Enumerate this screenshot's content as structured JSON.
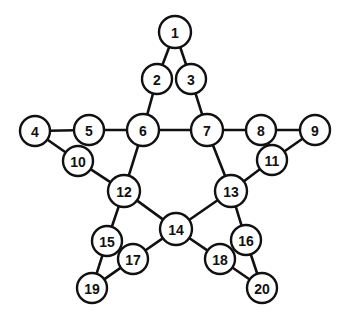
{
  "figure": {
    "type": "node-link-diagram",
    "background_color": "#ffffff",
    "edge_color": "#111111",
    "node_fill_color": "#ffffff",
    "node_stroke_color": "#111111",
    "label_color": "#111111",
    "node_radius": 15,
    "node_radius_small": 14,
    "edge_width": 2.6,
    "canvas": {
      "width": 343,
      "height": 314
    }
  },
  "nodes": [
    {
      "id": 1,
      "label": "1",
      "x": 175,
      "y": 32,
      "r": 16
    },
    {
      "id": 2,
      "label": "2",
      "x": 157,
      "y": 79,
      "r": 15
    },
    {
      "id": 3,
      "label": "3",
      "x": 191,
      "y": 79,
      "r": 15
    },
    {
      "id": 4,
      "label": "4",
      "x": 35,
      "y": 131,
      "r": 15
    },
    {
      "id": 5,
      "label": "5",
      "x": 89,
      "y": 130,
      "r": 15
    },
    {
      "id": 6,
      "label": "6",
      "x": 143,
      "y": 130,
      "r": 16
    },
    {
      "id": 7,
      "label": "7",
      "x": 207,
      "y": 130,
      "r": 16
    },
    {
      "id": 8,
      "label": "8",
      "x": 261,
      "y": 130,
      "r": 15
    },
    {
      "id": 9,
      "label": "9",
      "x": 315,
      "y": 130,
      "r": 15
    },
    {
      "id": 10,
      "label": "10",
      "x": 78,
      "y": 161,
      "r": 15
    },
    {
      "id": 11,
      "label": "11",
      "x": 272,
      "y": 160,
      "r": 15
    },
    {
      "id": 12,
      "label": "12",
      "x": 124,
      "y": 191,
      "r": 16
    },
    {
      "id": 13,
      "label": "13",
      "x": 231,
      "y": 191,
      "r": 16
    },
    {
      "id": 14,
      "label": "14",
      "x": 176,
      "y": 229,
      "r": 16
    },
    {
      "id": 15,
      "label": "15",
      "x": 107,
      "y": 241,
      "r": 15
    },
    {
      "id": 16,
      "label": "16",
      "x": 246,
      "y": 240,
      "r": 15
    },
    {
      "id": 17,
      "label": "17",
      "x": 133,
      "y": 259,
      "r": 15
    },
    {
      "id": 18,
      "label": "18",
      "x": 220,
      "y": 259,
      "r": 15
    },
    {
      "id": 19,
      "label": "19",
      "x": 92,
      "y": 288,
      "r": 15
    },
    {
      "id": 20,
      "label": "20",
      "x": 262,
      "y": 288,
      "r": 15
    }
  ],
  "edges": [
    {
      "from": 1,
      "to": 2
    },
    {
      "from": 1,
      "to": 3
    },
    {
      "from": 2,
      "to": 6
    },
    {
      "from": 3,
      "to": 7
    },
    {
      "from": 4,
      "to": 5
    },
    {
      "from": 4,
      "to": 10
    },
    {
      "from": 5,
      "to": 6
    },
    {
      "from": 6,
      "to": 7
    },
    {
      "from": 6,
      "to": 12
    },
    {
      "from": 7,
      "to": 8
    },
    {
      "from": 7,
      "to": 13
    },
    {
      "from": 8,
      "to": 9
    },
    {
      "from": 9,
      "to": 11
    },
    {
      "from": 10,
      "to": 12
    },
    {
      "from": 11,
      "to": 13
    },
    {
      "from": 12,
      "to": 14
    },
    {
      "from": 12,
      "to": 15
    },
    {
      "from": 13,
      "to": 14
    },
    {
      "from": 13,
      "to": 16
    },
    {
      "from": 14,
      "to": 17
    },
    {
      "from": 14,
      "to": 18
    },
    {
      "from": 15,
      "to": 19
    },
    {
      "from": 16,
      "to": 20
    },
    {
      "from": 17,
      "to": 19
    },
    {
      "from": 18,
      "to": 20
    }
  ]
}
